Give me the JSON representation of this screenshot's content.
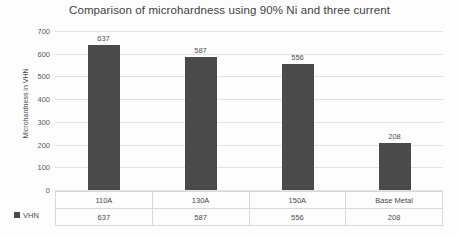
{
  "chart_data": {
    "type": "bar",
    "title": "Comparison of microhardness using 90% Ni and three current",
    "categories": [
      "110A",
      "130A",
      "150A",
      "Base Metal"
    ],
    "values": [
      637,
      587,
      556,
      208
    ],
    "series": [
      {
        "name": "VHN",
        "values": [
          637,
          587,
          556,
          208
        ]
      }
    ],
    "xlabel": "",
    "ylabel": "Microhardness in VHN",
    "ylim": [
      0,
      700
    ],
    "ytick_step": 100,
    "yticks": [
      700,
      600,
      500,
      400,
      300,
      200,
      100,
      0
    ],
    "ytick_labels": [
      "700",
      "600",
      "500",
      "400",
      "300",
      "200",
      "100",
      "0"
    ],
    "grid": true,
    "legend_position": "bottom-left",
    "data_table_visible": true,
    "bar_color": "#4a4a4a",
    "gridline_color": "#e2e2e2",
    "title_color": "#3f3f3f",
    "value_labels": [
      "637",
      "587",
      "556",
      "208"
    ]
  },
  "legend": {
    "marker_name": "series-color-swatch",
    "label": "VHN"
  }
}
